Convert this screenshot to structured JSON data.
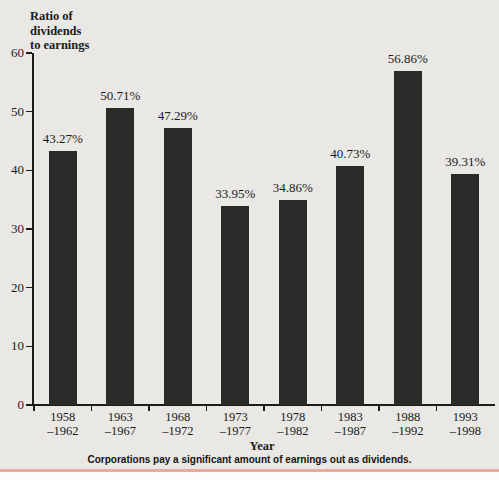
{
  "figure": {
    "y_axis_title": "Ratio of\ndividends\nto earnings",
    "x_axis_title": "Year",
    "caption": "Corporations pay a significant amount of earnings out as dividends."
  },
  "chart_data": {
    "type": "bar",
    "title": "",
    "ylabel": "Ratio of dividends to earnings",
    "xlabel": "Year",
    "categories": [
      "1958–1962",
      "1963–1967",
      "1968–1972",
      "1973–1977",
      "1978–1982",
      "1983–1987",
      "1988–1992",
      "1993–1998"
    ],
    "values": [
      43.27,
      50.71,
      47.29,
      33.95,
      34.86,
      40.73,
      56.86,
      39.31
    ],
    "value_labels": [
      "43.27%",
      "50.71%",
      "47.29%",
      "33.95%",
      "34.86%",
      "40.73%",
      "56.86%",
      "39.31%"
    ],
    "ylim": [
      0,
      60
    ],
    "yticks": [
      0,
      10,
      20,
      30,
      40,
      50,
      60
    ],
    "grid": false,
    "legend": "none",
    "colors": {
      "bar": "#2a2a28",
      "background": "#e9e8e5",
      "text": "#1b1b1a",
      "bottom_rule": "#eba99e"
    }
  }
}
